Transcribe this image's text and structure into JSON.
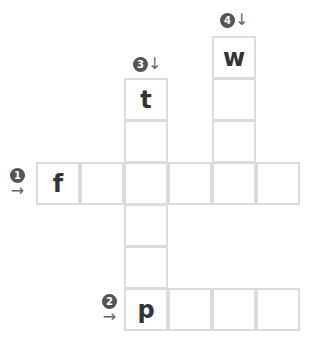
{
  "puzzle": {
    "cell_size": 44,
    "cells": [
      {
        "col": 0,
        "row": 3,
        "letter": "f"
      },
      {
        "col": 1,
        "row": 3,
        "letter": ""
      },
      {
        "col": 2,
        "row": 3,
        "letter": ""
      },
      {
        "col": 3,
        "row": 3,
        "letter": ""
      },
      {
        "col": 4,
        "row": 3,
        "letter": ""
      },
      {
        "col": 5,
        "row": 3,
        "letter": ""
      },
      {
        "col": 2,
        "row": 1,
        "letter": "t"
      },
      {
        "col": 2,
        "row": 2,
        "letter": ""
      },
      {
        "col": 2,
        "row": 4,
        "letter": ""
      },
      {
        "col": 2,
        "row": 5,
        "letter": ""
      },
      {
        "col": 2,
        "row": 6,
        "letter": "p"
      },
      {
        "col": 3,
        "row": 6,
        "letter": ""
      },
      {
        "col": 4,
        "row": 6,
        "letter": ""
      },
      {
        "col": 5,
        "row": 6,
        "letter": ""
      },
      {
        "col": 4,
        "row": 0,
        "letter": "w"
      },
      {
        "col": 4,
        "row": 1,
        "letter": ""
      },
      {
        "col": 4,
        "row": 2,
        "letter": ""
      }
    ],
    "clues": [
      {
        "number": "1",
        "direction": "across",
        "arrow": "→"
      },
      {
        "number": "2",
        "direction": "across",
        "arrow": "→"
      },
      {
        "number": "3",
        "direction": "down",
        "arrow": "↓"
      },
      {
        "number": "4",
        "direction": "down",
        "arrow": "↓"
      }
    ]
  }
}
